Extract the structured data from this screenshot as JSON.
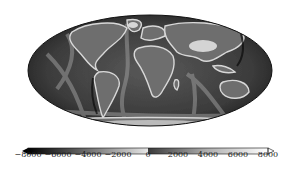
{
  "figure": {
    "type": "map",
    "projection": "mollweide",
    "colormap": {
      "name": "grayscale-diverging",
      "min": -8000,
      "max": 8000,
      "extend": "both",
      "ticks": [
        -8000,
        -6000,
        -4000,
        -2000,
        0,
        2000,
        4000,
        6000,
        8000
      ],
      "tick_labels": [
        "−8000",
        "−6000",
        "−4000",
        "−2000",
        "0",
        "2000",
        "4000",
        "6000",
        "8000"
      ],
      "colors": {
        "low": "#000000",
        "mid_ocean": "#a8a8a8",
        "zero_ocean": "#e0e0e0",
        "zero_land": "#3a3a3a",
        "high": "#ffffff"
      }
    }
  },
  "colorbar": {
    "labels": {
      "t0": "−8000",
      "t1": "−6000",
      "t2": "−4000",
      "t3": "−2000",
      "t4": "0",
      "t5": "2000",
      "t6": "4000",
      "t7": "6000",
      "t8": "8000"
    }
  }
}
